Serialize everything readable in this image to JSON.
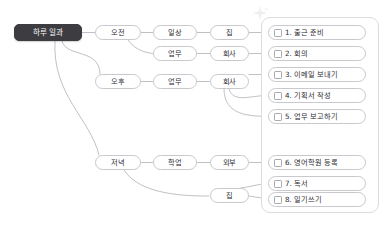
{
  "diagram": {
    "type": "mindmap",
    "title_node": {
      "label": "하루 일과",
      "color": "#3c3c41"
    },
    "decoration": {
      "icon": "sparkle-icon",
      "color": "#d8d8de"
    },
    "levels": {
      "time": [
        {
          "id": "morning",
          "label": "오전"
        },
        {
          "id": "afternoon",
          "label": "오후"
        },
        {
          "id": "evening",
          "label": "저녁"
        }
      ],
      "category": [
        {
          "id": "daily",
          "label": "일상"
        },
        {
          "id": "work-am",
          "label": "업무"
        },
        {
          "id": "work-pm",
          "label": "업무"
        },
        {
          "id": "study",
          "label": "학업"
        }
      ],
      "place": [
        {
          "id": "home-am",
          "label": "집"
        },
        {
          "id": "office-am",
          "label": "회사"
        },
        {
          "id": "office-pm",
          "label": "회사"
        },
        {
          "id": "outside",
          "label": "외부"
        },
        {
          "id": "home-pm",
          "label": "집"
        }
      ]
    },
    "tasks": [
      {
        "num": "1",
        "label": "1. 출근 준비",
        "checked": false
      },
      {
        "num": "2",
        "label": "2. 회의",
        "checked": false
      },
      {
        "num": "3",
        "label": "3. 이메일 보내기",
        "checked": false
      },
      {
        "num": "4",
        "label": "4. 기획서 작성",
        "checked": false
      },
      {
        "num": "5",
        "label": "5. 업무 보고하기",
        "checked": false
      },
      {
        "num": "6",
        "label": "6. 영어학원 등록",
        "checked": false
      },
      {
        "num": "7",
        "label": "7. 독서",
        "checked": false
      },
      {
        "num": "8",
        "label": "8. 일기쓰기",
        "checked": false
      }
    ],
    "colors": {
      "node_border": "#c9c9cd",
      "edge": "#b9b9c0",
      "text": "#2e2e33",
      "root_bg": "#3c3c41",
      "group_border": "#dcdce0",
      "canvas_bg": "#ffffff"
    }
  }
}
